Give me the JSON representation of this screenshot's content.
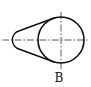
{
  "diagram": {
    "type": "technical-drawing",
    "label": "B",
    "colors": {
      "outline": "#111111",
      "centerline": "#333333",
      "background": "#ffffff"
    },
    "large_circle": {
      "cx": 61,
      "cy": 40,
      "r": 23
    },
    "small_arc": {
      "cx": 17,
      "cy": 40,
      "r": 9.5
    },
    "centerlines": {
      "horizontal": {
        "x1": 2,
        "y1": 40,
        "x2": 89,
        "y2": 40
      },
      "vertical": {
        "x1": 61,
        "y1": 12,
        "x2": 61,
        "y2": 69
      }
    }
  }
}
